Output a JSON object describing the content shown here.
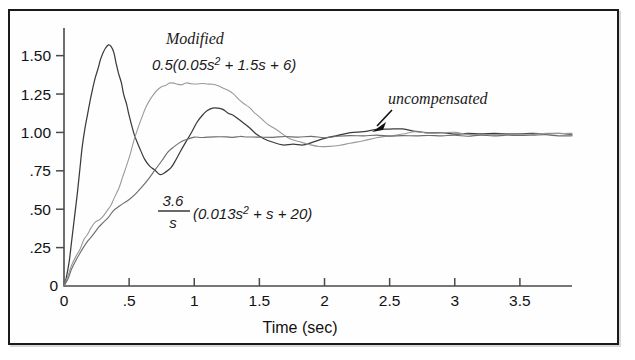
{
  "figure": {
    "title": "",
    "frame_color": "#1a1a1a",
    "background": "#ffffff"
  },
  "chart_data": {
    "type": "line",
    "title": "",
    "subtitle": "",
    "xlabel": "Time (sec)",
    "ylabel": "",
    "xlim": [
      0,
      3.9
    ],
    "ylim": [
      0,
      1.68
    ],
    "grid": false,
    "legend_position": "inline-annotations",
    "x_ticks": [
      0,
      0.5,
      1,
      1.5,
      2,
      2.5,
      3,
      3.5
    ],
    "x_tick_labels": [
      "0",
      ".5",
      "1",
      "1.5",
      "2",
      "2.5",
      "3",
      "3.5"
    ],
    "y_ticks": [
      0,
      0.25,
      0.5,
      0.75,
      1.0,
      1.25,
      1.5
    ],
    "y_tick_labels": [
      "0",
      ".25",
      ".50",
      ".75",
      "1.00",
      "1.25",
      "1.50"
    ],
    "y_origin_label": "0",
    "x_origin_label": "0",
    "series": [
      {
        "name": "modified-0.5(0.05s^2+1.5s+6)",
        "label": "0.5(0.05s² + 1.5s + 6)",
        "color": "#3b3b3b",
        "stroke_width": 1.25,
        "x": [
          0.0,
          0.02,
          0.04,
          0.06,
          0.08,
          0.1,
          0.12,
          0.14,
          0.16,
          0.18,
          0.2,
          0.22,
          0.24,
          0.26,
          0.28,
          0.3,
          0.32,
          0.34,
          0.36,
          0.38,
          0.4,
          0.42,
          0.44,
          0.46,
          0.48,
          0.5,
          0.54,
          0.58,
          0.62,
          0.66,
          0.7,
          0.74,
          0.78,
          0.82,
          0.86,
          0.9,
          0.94,
          0.98,
          1.02,
          1.06,
          1.1,
          1.14,
          1.18,
          1.22,
          1.26,
          1.3,
          1.36,
          1.42,
          1.48,
          1.54,
          1.6,
          1.68,
          1.76,
          1.84,
          1.92,
          2.0,
          2.1,
          2.2,
          2.3,
          2.4,
          2.5,
          2.6,
          2.7,
          2.8,
          2.9,
          3.0,
          3.1,
          3.2,
          3.3,
          3.4,
          3.5,
          3.6,
          3.7,
          3.8,
          3.9
        ],
        "y": [
          0.0,
          0.06,
          0.16,
          0.29,
          0.44,
          0.6,
          0.76,
          0.9,
          1.02,
          1.12,
          1.21,
          1.29,
          1.36,
          1.42,
          1.47,
          1.52,
          1.55,
          1.57,
          1.56,
          1.52,
          1.46,
          1.39,
          1.32,
          1.25,
          1.18,
          1.11,
          0.99,
          0.9,
          0.83,
          0.78,
          0.75,
          0.73,
          0.74,
          0.77,
          0.82,
          0.88,
          0.94,
          1.0,
          1.06,
          1.11,
          1.14,
          1.16,
          1.16,
          1.15,
          1.13,
          1.11,
          1.07,
          1.03,
          0.99,
          0.96,
          0.94,
          0.92,
          0.92,
          0.92,
          0.94,
          0.96,
          0.98,
          1.0,
          1.01,
          1.02,
          1.02,
          1.02,
          1.01,
          1.0,
          1.0,
          0.99,
          0.99,
          0.99,
          0.99,
          0.99,
          0.99,
          0.99,
          0.99,
          0.99,
          0.99
        ]
      },
      {
        "name": "modified-light-overshoot",
        "label": "",
        "color": "#9a9a9a",
        "stroke_width": 1.1,
        "x": [
          0.0,
          0.03,
          0.06,
          0.09,
          0.12,
          0.15,
          0.18,
          0.21,
          0.24,
          0.27,
          0.3,
          0.33,
          0.36,
          0.39,
          0.42,
          0.45,
          0.48,
          0.51,
          0.54,
          0.57,
          0.6,
          0.63,
          0.66,
          0.69,
          0.72,
          0.75,
          0.78,
          0.81,
          0.84,
          0.87,
          0.9,
          0.94,
          0.98,
          1.02,
          1.06,
          1.1,
          1.14,
          1.18,
          1.22,
          1.26,
          1.3,
          1.34,
          1.38,
          1.42,
          1.46,
          1.5,
          1.56,
          1.62,
          1.68,
          1.74,
          1.8,
          1.88,
          1.96,
          2.04,
          2.12,
          2.2,
          2.3,
          2.4,
          2.5,
          2.6,
          2.7,
          2.8,
          2.9,
          3.0,
          3.1,
          3.2,
          3.3,
          3.4,
          3.5,
          3.6,
          3.7,
          3.8,
          3.9
        ],
        "y": [
          0.0,
          0.06,
          0.13,
          0.19,
          0.24,
          0.3,
          0.34,
          0.38,
          0.41,
          0.43,
          0.46,
          0.49,
          0.53,
          0.58,
          0.64,
          0.71,
          0.79,
          0.87,
          0.95,
          1.03,
          1.1,
          1.16,
          1.21,
          1.25,
          1.28,
          1.3,
          1.31,
          1.32,
          1.32,
          1.31,
          1.31,
          1.32,
          1.32,
          1.32,
          1.32,
          1.32,
          1.31,
          1.3,
          1.29,
          1.27,
          1.25,
          1.22,
          1.19,
          1.16,
          1.13,
          1.1,
          1.06,
          1.02,
          0.99,
          0.96,
          0.94,
          0.92,
          0.91,
          0.91,
          0.92,
          0.93,
          0.95,
          0.97,
          0.98,
          0.99,
          1.0,
          1.0,
          1.0,
          1.0,
          0.99,
          0.99,
          0.99,
          0.99,
          0.99,
          0.99,
          0.99,
          0.99,
          0.99
        ]
      },
      {
        "name": "uncompensated-3.6/s(0.013s^2+s+20)",
        "label": "uncompensated",
        "color": "#6e6e6e",
        "stroke_width": 1.15,
        "x": [
          0.0,
          0.03,
          0.06,
          0.09,
          0.12,
          0.15,
          0.18,
          0.21,
          0.24,
          0.27,
          0.3,
          0.34,
          0.38,
          0.42,
          0.46,
          0.5,
          0.55,
          0.6,
          0.65,
          0.7,
          0.75,
          0.8,
          0.85,
          0.9,
          0.95,
          1.0,
          1.05,
          1.1,
          1.15,
          1.2,
          1.25,
          1.3,
          1.35,
          1.4,
          1.45,
          1.5,
          1.6,
          1.7,
          1.8,
          1.9,
          2.0,
          2.1,
          2.2,
          2.3,
          2.4,
          2.5,
          2.6,
          2.7,
          2.8,
          2.9,
          3.0,
          3.1,
          3.2,
          3.3,
          3.4,
          3.5,
          3.6,
          3.7,
          3.8,
          3.9
        ],
        "y": [
          0.0,
          0.05,
          0.11,
          0.16,
          0.21,
          0.25,
          0.29,
          0.32,
          0.35,
          0.38,
          0.41,
          0.45,
          0.49,
          0.52,
          0.54,
          0.56,
          0.6,
          0.65,
          0.7,
          0.76,
          0.82,
          0.87,
          0.91,
          0.94,
          0.96,
          0.97,
          0.97,
          0.97,
          0.97,
          0.97,
          0.97,
          0.97,
          0.97,
          0.97,
          0.97,
          0.97,
          0.97,
          0.97,
          0.97,
          0.97,
          0.97,
          0.97,
          0.98,
          0.98,
          0.98,
          0.98,
          0.98,
          0.98,
          0.98,
          0.98,
          0.98,
          0.98,
          0.98,
          0.98,
          0.98,
          0.98,
          0.98,
          0.98,
          0.98,
          0.98
        ]
      }
    ],
    "annotations": [
      {
        "name": "modified-label",
        "text": "Modified",
        "x": 0.88,
        "y": 1.62,
        "style": "serif-italic"
      },
      {
        "name": "modified-formula",
        "text": "0.5(0.05s² + 1.5s + 6)",
        "x": 0.88,
        "y": 1.43,
        "style": "sans-italic"
      },
      {
        "name": "uncompensated-label",
        "text": "uncompensated",
        "x": 2.32,
        "y": 1.2,
        "style": "serif-italic"
      },
      {
        "name": "uncompensated-formula",
        "text": "(0.013s² + s + 20)",
        "numerator": "3.6",
        "denominator": "s",
        "x": 1.0,
        "y": 0.47,
        "style": "sans-italic-fraction"
      }
    ],
    "arrow": {
      "name": "uncompensated-pointer",
      "from_x": 2.38,
      "from_y": 1.12,
      "to_x": 2.27,
      "to_y": 0.99
    }
  },
  "annotation_text": {
    "modified": "Modified",
    "modified_formula_main": "0.5(0.05s",
    "modified_formula_sup": "2",
    "modified_formula_tail": " + 1.5s + 6)",
    "uncompensated": "uncompensated",
    "frac_numerator": "3.6",
    "frac_denominator": "s",
    "uncomp_formula_main": "(0.013s",
    "uncomp_formula_sup": "2",
    "uncomp_formula_tail": " + s + 20)"
  },
  "axes": {
    "x_title": "Time (sec)",
    "y_origin": "0",
    "x_origin": "0"
  }
}
